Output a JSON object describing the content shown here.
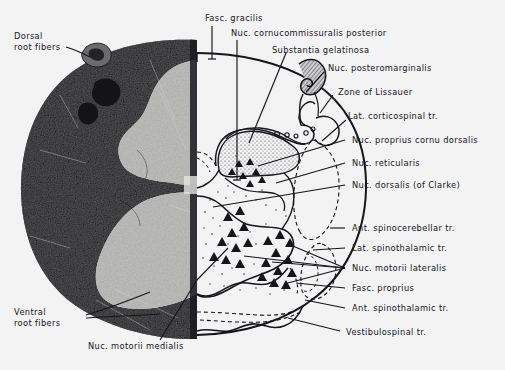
{
  "figure": {
    "background_color": "#f3f3f4",
    "ink_color": "#15151a",
    "photo_side": "left",
    "diagram_side": "right"
  },
  "labels": {
    "dorsal_root_fibers": "Dorsal\nroot fibers",
    "fasc_gracilis": "Fasc. gracilis",
    "nuc_cornucommissuralis_posterior": "Nuc. cornucommissuralis posterior",
    "substantia_gelatinosa": "Substantia gelatinosa",
    "nuc_posteromarginalis": "Nuc. posteromarginalis",
    "zone_of_lissauer": "Zone of  Lissauer",
    "lat_corticospinal_tr": "Lat. corticospinal  tr.",
    "nuc_proprius_cornu_dorsalis": "Nuc. proprius cornu dorsalis",
    "nuc_reticularis": "Nuc. reticularis",
    "nuc_dorsalis_of_clarke": "Nuc. dorsalis (of Clarke)",
    "ant_spinocerebellar_tr": "Ant. spinocerebellar  tr.",
    "lat_spinothalamic_tr": "Lat. spinothalamic  tr.",
    "nuc_motorii_lateralis": "Nuc. motorii  lateralis",
    "fasc_proprius": "Fasc. proprius",
    "ant_spinothalamic_tr": "Ant. spinothalamic  tr.",
    "vestibulospinal_tr": "Vestibulospinal  tr.",
    "ventral_root_fibers": "Ventral\nroot fibers",
    "nuc_motorii_medialis": "Nuc. motorii  medialis"
  },
  "structures": {
    "white_matter": "white matter (outer, dark in photomicrograph)",
    "gray_matter": "gray matter (butterfly / H-shaped, light in photomicrograph)",
    "dorsal_horn": "posterior (dorsal) horn",
    "ventral_horn": "anterior (ventral) horn",
    "central_canal": "central canal region"
  }
}
